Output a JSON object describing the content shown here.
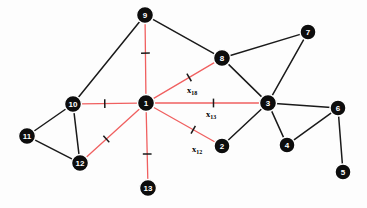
{
  "figure": {
    "type": "network-graph",
    "background_color": "#fdfdfd",
    "node_fill_color": "#0d0d0d",
    "node_label_color": "#ffffff",
    "black_edge_color": "#1a1a1a",
    "red_edge_color": "#f06060",
    "tick_color": "#1a1a1a",
    "width": 367,
    "height": 208
  },
  "nodes": [
    {
      "id": "1",
      "label": "1",
      "x": 146,
      "y": 103,
      "r": 8.5
    },
    {
      "id": "2",
      "label": "2",
      "x": 222,
      "y": 146,
      "r": 8.0
    },
    {
      "id": "3",
      "label": "3",
      "x": 268,
      "y": 103,
      "r": 8.5
    },
    {
      "id": "4",
      "label": "4",
      "x": 287,
      "y": 145,
      "r": 8.0
    },
    {
      "id": "5",
      "label": "5",
      "x": 343,
      "y": 172,
      "r": 8.0
    },
    {
      "id": "6",
      "label": "6",
      "x": 338,
      "y": 108,
      "r": 8.0
    },
    {
      "id": "7",
      "label": "7",
      "x": 308,
      "y": 32,
      "r": 8.0
    },
    {
      "id": "8",
      "label": "8",
      "x": 222,
      "y": 58,
      "r": 8.5
    },
    {
      "id": "9",
      "label": "9",
      "x": 145,
      "y": 15,
      "r": 8.5
    },
    {
      "id": "10",
      "label": "10",
      "x": 73,
      "y": 104,
      "r": 8.5
    },
    {
      "id": "11",
      "label": "11",
      "x": 27,
      "y": 136,
      "r": 8.5
    },
    {
      "id": "12",
      "label": "12",
      "x": 80,
      "y": 163,
      "r": 8.5
    },
    {
      "id": "13",
      "label": "13",
      "x": 148,
      "y": 188,
      "r": 8.5
    }
  ],
  "edges": [
    {
      "id": "e-1-9",
      "from": "9",
      "to": "1",
      "color": "red",
      "tick": true,
      "tick_t": 0.42
    },
    {
      "id": "e-1-10",
      "from": "10",
      "to": "1",
      "color": "red",
      "tick": true,
      "tick_t": 0.42
    },
    {
      "id": "e-1-12",
      "from": "12",
      "to": "1",
      "color": "red",
      "tick": true,
      "tick_t": 0.38
    },
    {
      "id": "e-1-13",
      "from": "13",
      "to": "1",
      "color": "red",
      "tick": true,
      "tick_t": 0.38
    },
    {
      "id": "e-1-8",
      "from": "1",
      "to": "8",
      "color": "red",
      "tick": true,
      "tick_t": 0.58,
      "label": "x18"
    },
    {
      "id": "e-1-3",
      "from": "1",
      "to": "3",
      "color": "red",
      "tick": true,
      "tick_t": 0.56,
      "label": "x13"
    },
    {
      "id": "e-1-2",
      "from": "1",
      "to": "2",
      "color": "red",
      "tick": true,
      "tick_t": 0.64,
      "label": "x12"
    },
    {
      "id": "e-9-10",
      "from": "9",
      "to": "10",
      "color": "black",
      "tick": false
    },
    {
      "id": "e-9-8",
      "from": "9",
      "to": "8",
      "color": "black",
      "tick": false
    },
    {
      "id": "e-10-11",
      "from": "10",
      "to": "11",
      "color": "black",
      "tick": false
    },
    {
      "id": "e-10-12",
      "from": "10",
      "to": "12",
      "color": "black",
      "tick": false
    },
    {
      "id": "e-11-12",
      "from": "11",
      "to": "12",
      "color": "black",
      "tick": false
    },
    {
      "id": "e-8-7",
      "from": "8",
      "to": "7",
      "color": "black",
      "tick": false
    },
    {
      "id": "e-8-3",
      "from": "8",
      "to": "3",
      "color": "black",
      "tick": false
    },
    {
      "id": "e-7-3",
      "from": "7",
      "to": "3",
      "color": "black",
      "tick": false
    },
    {
      "id": "e-3-2",
      "from": "3",
      "to": "2",
      "color": "black",
      "tick": false
    },
    {
      "id": "e-3-4",
      "from": "3",
      "to": "4",
      "color": "black",
      "tick": false
    },
    {
      "id": "e-3-6",
      "from": "3",
      "to": "6",
      "color": "black",
      "tick": false
    },
    {
      "id": "e-4-6",
      "from": "4",
      "to": "6",
      "color": "black",
      "tick": false
    },
    {
      "id": "e-6-5",
      "from": "6",
      "to": "5",
      "color": "black",
      "tick": false
    }
  ],
  "edge_labels": [
    {
      "id": "label-x18",
      "base": "x",
      "sub": "18",
      "x": 192,
      "y": 93
    },
    {
      "id": "label-x13",
      "base": "x",
      "sub": "13",
      "x": 211,
      "y": 117
    },
    {
      "id": "label-x12",
      "base": "x",
      "sub": "12",
      "x": 197,
      "y": 152
    }
  ]
}
